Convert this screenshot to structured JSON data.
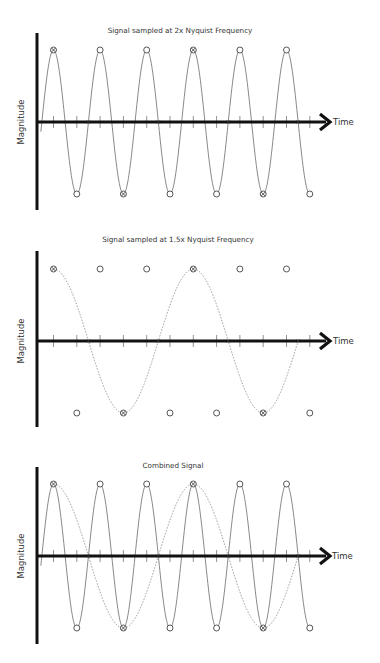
{
  "figure": {
    "panels": [
      {
        "id": "top",
        "title": "Signal sampled at 2x Nyquist Frequency",
        "y_label": "Magnitude",
        "x_label": "Time",
        "show_signal": true,
        "show_alias": false,
        "top_markers": [
          "crossed",
          "open",
          "open",
          "crossed",
          "open",
          "open"
        ],
        "bottom_markers": [
          "open",
          "crossed",
          "open",
          "open",
          "crossed",
          "open"
        ],
        "x_marks": [
          1,
          3,
          5,
          7
        ]
      },
      {
        "id": "middle",
        "title": "Signal sampled at 1.5x Nyquist Frequency",
        "y_label": "Magnitude",
        "x_label": "Time",
        "show_signal": false,
        "show_alias": true,
        "top_markers": [
          "crossed",
          "open",
          "open",
          "crossed",
          "open",
          "open"
        ],
        "bottom_markers": [
          "open",
          "crossed",
          "open",
          "open",
          "crossed",
          "open"
        ],
        "x_marks": [
          1,
          3,
          5,
          7
        ]
      },
      {
        "id": "bottom",
        "title": "Combined Signal",
        "y_label": "Magnitude",
        "x_label": "Time",
        "show_signal": true,
        "show_alias": true,
        "top_markers": [
          "crossed",
          "open",
          "open",
          "crossed",
          "open",
          "open"
        ],
        "bottom_markers": [
          "open",
          "crossed",
          "open",
          "open",
          "crossed",
          "open"
        ],
        "x_marks": [
          1,
          3,
          5,
          7
        ]
      }
    ],
    "legend_notes": {
      "open_circle": "sample at 2x Nyquist",
      "x_mark": "sample at 1.5x Nyquist",
      "crossed_circle": "sample common to both rates"
    },
    "colors": {
      "axis": "#111111",
      "signal": "#6a6a6a",
      "alias": "#8a8a8a",
      "marker": "#444444"
    }
  }
}
